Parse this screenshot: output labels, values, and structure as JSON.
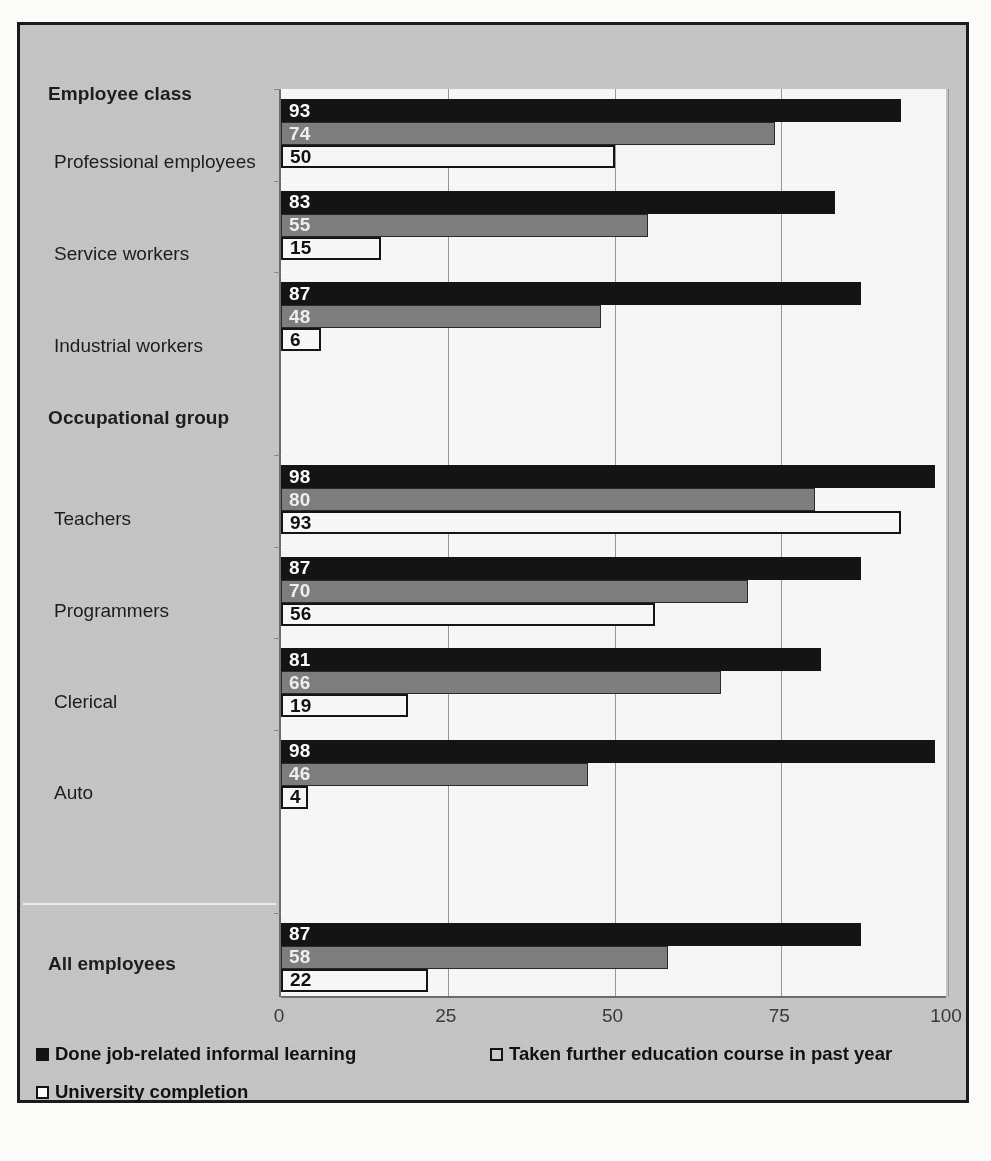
{
  "chart_data": {
    "type": "bar",
    "orientation": "horizontal",
    "title": "",
    "xlabel": "",
    "ylabel": "",
    "xlim": [
      0,
      100
    ],
    "xticks": [
      "0",
      "25",
      "50",
      "75",
      "100"
    ],
    "grid": true,
    "legend_position": "bottom",
    "series": [
      {
        "name": "Done job-related informal learning",
        "swatch": "black-filled-square",
        "values": [
          93,
          83,
          87,
          98,
          87,
          81,
          98,
          87
        ]
      },
      {
        "name": "Taken further education course in past year",
        "swatch": "gray-filled-square",
        "values": [
          74,
          55,
          48,
          80,
          70,
          66,
          46,
          58
        ]
      },
      {
        "name": "University completion",
        "swatch": "white-outlined-square",
        "values": [
          50,
          15,
          6,
          93,
          56,
          19,
          4,
          22
        ]
      }
    ],
    "categories": [
      "Professional employees",
      "Service workers",
      "Industrial workers",
      "Teachers",
      "Programmers",
      "Clerical",
      "Auto",
      "All employees"
    ],
    "group_headers": [
      "Employee class",
      "Occupational group"
    ]
  },
  "axis": {
    "ticks": [
      {
        "label": "0",
        "value": 0
      },
      {
        "label": "25",
        "value": 25
      },
      {
        "label": "50",
        "value": 50
      },
      {
        "label": "75",
        "value": 75
      },
      {
        "label": "100",
        "value": 100
      }
    ]
  },
  "rows": [
    {
      "kind": "header",
      "label": "Employee class"
    },
    {
      "kind": "data",
      "label": "Professional employees",
      "values": [
        93,
        74,
        50
      ]
    },
    {
      "kind": "data",
      "label": "Service workers",
      "values": [
        83,
        55,
        15
      ]
    },
    {
      "kind": "data",
      "label": "Industrial workers",
      "values": [
        87,
        48,
        6
      ]
    },
    {
      "kind": "header",
      "label": "Occupational group"
    },
    {
      "kind": "data",
      "label": "Teachers",
      "values": [
        98,
        80,
        93
      ]
    },
    {
      "kind": "data",
      "label": "Programmers",
      "values": [
        87,
        70,
        56
      ]
    },
    {
      "kind": "data",
      "label": "Clerical",
      "values": [
        81,
        66,
        19
      ]
    },
    {
      "kind": "data",
      "label": "Auto",
      "values": [
        98,
        46,
        4
      ]
    },
    {
      "kind": "total",
      "label": "All employees",
      "values": [
        87,
        58,
        22
      ]
    }
  ],
  "legend": {
    "items": [
      {
        "label": "Done job-related informal learning",
        "style": "s0"
      },
      {
        "label": "Taken further education course in past year",
        "style": "s1"
      },
      {
        "label": "University completion",
        "style": "s2"
      }
    ]
  },
  "colors": {
    "series_1": "#141414",
    "series_2": "#7f7f7f",
    "series_3": "#ffffff",
    "figure_background": "#c7c7c7",
    "plot_background": "#fafafa",
    "frame": "#1b1b1b"
  }
}
